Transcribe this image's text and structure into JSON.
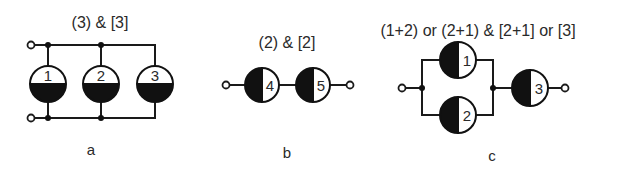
{
  "diagram_a": {
    "title": "(3) & [3]",
    "caption": "a",
    "cells": [
      {
        "label": "1"
      },
      {
        "label": "2"
      },
      {
        "label": "3"
      }
    ],
    "topology": "parallel"
  },
  "diagram_b": {
    "title": "(2) & [2]",
    "caption": "b",
    "cells": [
      {
        "label": "4"
      },
      {
        "label": "5"
      }
    ],
    "topology": "series"
  },
  "diagram_c": {
    "title": "(1+2) or (2+1) & [2+1] or [3]",
    "caption": "c",
    "cells": [
      {
        "label": "1"
      },
      {
        "label": "2"
      },
      {
        "label": "3"
      }
    ],
    "topology": "parallel(1,2) + series(3)"
  },
  "colors": {
    "ink": "#111111",
    "text": "#2a2a2a",
    "background": "#ffffff"
  }
}
